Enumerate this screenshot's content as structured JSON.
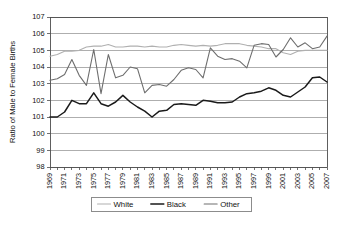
{
  "chart_data": {
    "type": "line",
    "title": "",
    "xlabel": "",
    "ylabel": "Ratio of Male to Female Births",
    "ylim": [
      98,
      107
    ],
    "ytick_values": [
      98,
      99,
      100,
      101,
      102,
      103,
      104,
      105,
      106,
      107
    ],
    "ytick_labels": [
      "98",
      "99",
      "100",
      "101",
      "102",
      "103",
      "104",
      "105",
      "106",
      "107"
    ],
    "grid": true,
    "legend_position": "bottom",
    "x": [
      1969,
      1970,
      1971,
      1972,
      1973,
      1974,
      1975,
      1976,
      1977,
      1978,
      1979,
      1980,
      1981,
      1982,
      1983,
      1984,
      1985,
      1986,
      1987,
      1988,
      1989,
      1990,
      1991,
      1992,
      1993,
      1994,
      1995,
      1996,
      1997,
      1998,
      1999,
      2000,
      2001,
      2002,
      2003,
      2004,
      2005,
      2006,
      2007
    ],
    "xtick_labels": [
      "1969",
      "1971",
      "1973",
      "1975",
      "1977",
      "1979",
      "1981",
      "1983",
      "1985",
      "1987",
      "1989",
      "1991",
      "1993",
      "1995",
      "1997",
      "1999",
      "2001",
      "2003",
      "2005",
      "2007"
    ],
    "xtick_values": [
      1969,
      1971,
      1973,
      1975,
      1977,
      1979,
      1981,
      1983,
      1985,
      1987,
      1989,
      1991,
      1993,
      1995,
      1997,
      1999,
      2001,
      2003,
      2005,
      2007
    ],
    "series": [
      {
        "name": "White",
        "color": "#b0b0b0",
        "width": 1.1,
        "values": [
          104.65,
          104.75,
          104.95,
          104.95,
          105.0,
          105.2,
          105.25,
          105.25,
          105.35,
          105.2,
          105.2,
          105.25,
          105.25,
          105.2,
          105.25,
          105.2,
          105.2,
          105.3,
          105.35,
          105.3,
          105.25,
          105.3,
          105.25,
          105.3,
          105.4,
          105.4,
          105.4,
          105.3,
          105.25,
          105.2,
          105.1,
          105.1,
          104.85,
          104.75,
          104.95,
          105.0,
          105.0,
          105.0,
          105.0
        ]
      },
      {
        "name": "Black",
        "color": "#1a1a1a",
        "width": 1.5,
        "values": [
          101.0,
          101.0,
          101.3,
          102.0,
          101.8,
          101.8,
          102.45,
          101.8,
          101.65,
          101.9,
          102.3,
          101.9,
          101.6,
          101.35,
          101.0,
          101.35,
          101.4,
          101.75,
          101.8,
          101.75,
          101.7,
          102.0,
          101.95,
          101.85,
          101.85,
          101.9,
          102.2,
          102.4,
          102.45,
          102.55,
          102.75,
          102.6,
          102.3,
          102.2,
          102.5,
          102.8,
          103.35,
          103.4,
          103.1
        ]
      },
      {
        "name": "Other",
        "color": "#6e6e6e",
        "width": 1.1,
        "values": [
          103.2,
          103.3,
          103.55,
          104.45,
          103.5,
          102.9,
          105.05,
          102.4,
          104.75,
          103.35,
          103.5,
          104.0,
          103.9,
          102.45,
          102.9,
          102.95,
          102.85,
          103.25,
          103.8,
          103.95,
          103.85,
          103.35,
          105.15,
          104.65,
          104.45,
          104.5,
          104.35,
          103.95,
          105.3,
          105.4,
          105.35,
          104.6,
          105.05,
          105.75,
          105.2,
          105.45,
          105.1,
          105.2,
          105.85
        ]
      }
    ],
    "series_black_tail": {
      "name": "Black",
      "note": "continuation",
      "values": [
        103.6,
        103.7,
        103.55,
        104.1
      ]
    },
    "legend_items": [
      {
        "label": "White",
        "color": "#b0b0b0",
        "width": 1.1
      },
      {
        "label": "Black",
        "color": "#1a1a1a",
        "width": 1.5
      },
      {
        "label": "Other",
        "color": "#6e6e6e",
        "width": 1.1
      }
    ]
  },
  "plot_geometry": {
    "left": 50,
    "right": 327,
    "top": 17,
    "bottom": 167
  }
}
